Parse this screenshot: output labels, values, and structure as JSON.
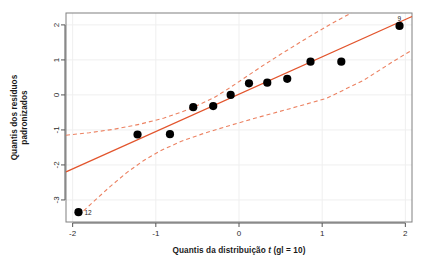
{
  "chart_data": {
    "type": "scatter",
    "title": "",
    "xlabel": "Quantis da distribuição t (gl = 10)",
    "xlabel_parts": {
      "before": "Quantis da distribuição ",
      "italic": "t",
      "after": " (gl = 10)"
    },
    "ylabel": "Quantis dos resíduos padronizados",
    "ylabel_line1": "Quantis dos resíduos",
    "ylabel_line2": "padronizados",
    "xlim": [
      -2.08,
      2.08
    ],
    "ylim": [
      -3.63,
      2.34
    ],
    "xticks": [
      -2,
      -1,
      0,
      1,
      2
    ],
    "xticklabels": [
      "-2",
      "-1",
      "0",
      "1",
      "2"
    ],
    "yticks": [
      2,
      1,
      0,
      -1,
      -2,
      -3
    ],
    "yticklabels": [
      "2",
      "1",
      "0",
      "-1",
      "-2",
      "-3"
    ],
    "grid": true,
    "legend": "none",
    "point_color": "#000000",
    "line_color": "#E2542C",
    "band_color": "#EC8262",
    "grid_color": "#EFEFEF",
    "box_color": "#808080",
    "x": [
      -1.93,
      -1.22,
      -0.83,
      -0.55,
      -0.31,
      -0.1,
      0.12,
      0.34,
      0.58,
      0.86,
      1.23,
      1.93
    ],
    "y": [
      -3.35,
      -1.13,
      -1.12,
      -0.35,
      -0.32,
      0.0,
      0.33,
      0.35,
      0.46,
      0.95,
      0.95,
      1.97
    ],
    "point_labels": [
      {
        "index": 0,
        "text": "12",
        "dx": 6,
        "dy": 3
      },
      {
        "index": 11,
        "text": "9",
        "dx": -2,
        "dy": -5
      }
    ],
    "reference_line": {
      "x1": -2.08,
      "y1": -2.2,
      "x2": 2.08,
      "y2": 2.24
    },
    "band_upper": [
      [
        -2.08,
        -1.15
      ],
      [
        -1.8,
        -1.08
      ],
      [
        -1.5,
        -0.98
      ],
      [
        -1.2,
        -0.84
      ],
      [
        -0.9,
        -0.66
      ],
      [
        -0.6,
        -0.41
      ],
      [
        -0.3,
        -0.08
      ],
      [
        -0.1,
        0.22
      ],
      [
        0.05,
        0.46
      ],
      [
        0.25,
        0.78
      ],
      [
        0.5,
        1.16
      ],
      [
        0.8,
        1.6
      ],
      [
        1.1,
        2.02
      ],
      [
        1.35,
        2.34
      ]
    ],
    "band_lower": [
      [
        -1.93,
        -3.45
      ],
      [
        -1.75,
        -3.05
      ],
      [
        -1.55,
        -2.62
      ],
      [
        -1.35,
        -2.22
      ],
      [
        -1.15,
        -1.88
      ],
      [
        -0.95,
        -1.6
      ],
      [
        -0.7,
        -1.33
      ],
      [
        -0.45,
        -1.12
      ],
      [
        -0.15,
        -0.9
      ],
      [
        0.2,
        -0.66
      ],
      [
        0.6,
        -0.4
      ],
      [
        1.05,
        -0.1
      ],
      [
        1.5,
        0.42
      ],
      [
        1.85,
        0.95
      ],
      [
        2.08,
        1.28
      ]
    ]
  }
}
